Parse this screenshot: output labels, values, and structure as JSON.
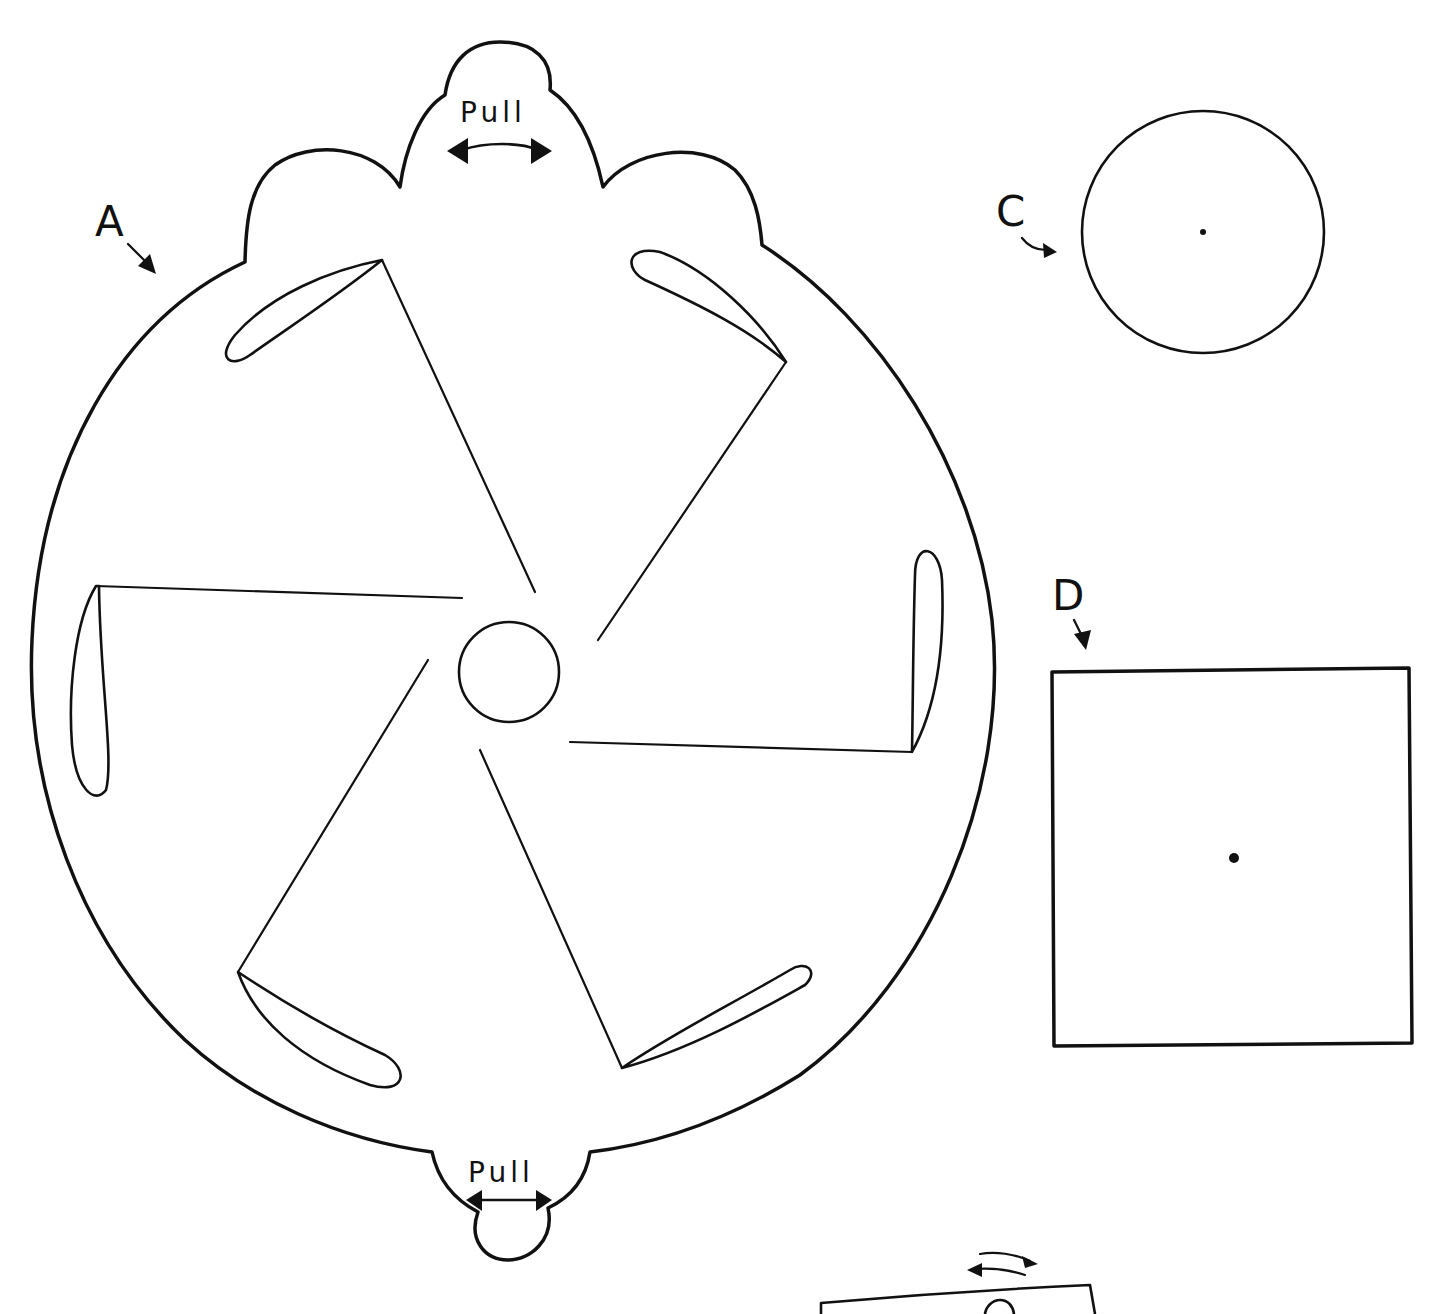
{
  "sheet": {
    "background": "#ffffff",
    "ink": "#111111",
    "description": "Pinwheel toy cut-out template pieces"
  },
  "pieces": {
    "a": {
      "label": "A",
      "shape": "wheel with five curved blades, center hub hole, two pull tabs",
      "top_tab": {
        "label": "Pull",
        "arrow": "double-headed-arrow"
      },
      "bottom_tab": {
        "label": "Pull",
        "arrow": "double-headed-arrow"
      },
      "blade_count": 5,
      "center_hole": "circle"
    },
    "c": {
      "label": "C",
      "shape": "circle with center dot"
    },
    "d": {
      "label": "D",
      "shape": "square with center dot"
    },
    "partial_piece": {
      "shape": "rectangle (cut off at bottom edge)",
      "arrow": "curved-double-arrow"
    }
  }
}
